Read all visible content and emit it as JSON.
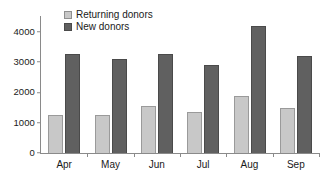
{
  "chart_data": {
    "type": "bar",
    "title": "",
    "xlabel": "",
    "ylabel": "",
    "categories": [
      "Apr",
      "May",
      "Jun",
      "Jul",
      "Aug",
      "Sep"
    ],
    "series": [
      {
        "name": "Returning donors",
        "color": "#c8c8c8",
        "values": [
          1250,
          1250,
          1550,
          1350,
          1880,
          1470
        ]
      },
      {
        "name": "New donors",
        "color": "#606060",
        "values": [
          3280,
          3100,
          3280,
          2900,
          4200,
          3200
        ]
      }
    ],
    "yticks": [
      0,
      1000,
      2000,
      3000,
      4000
    ],
    "ytick_labels": [
      "0",
      "1000",
      "2000",
      "3000",
      "4000"
    ],
    "ylim": [
      0,
      4450
    ],
    "grid": false,
    "legend_position": "top-left-inside"
  },
  "legend": {
    "items": [
      {
        "label": "Returning donors",
        "swatch": "legend-swatch-returning"
      },
      {
        "label": "New donors",
        "swatch": "legend-swatch-new"
      }
    ]
  }
}
